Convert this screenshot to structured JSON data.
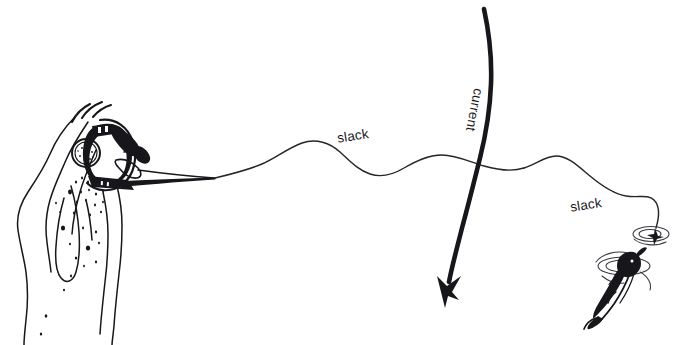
{
  "figure": {
    "background_color": "#ffffff",
    "ink_color": "#17161a",
    "width": 682,
    "height": 345
  },
  "labels": {
    "slack_upper": "slack",
    "slack_lower": "slack",
    "current": "current"
  },
  "elements": {
    "angler_arm": "angler-arm",
    "fishing_reel": "fishing-reel",
    "rod_tip": "rod-tip",
    "fishing_line": "fishing-line",
    "current_arrow": "current-arrow",
    "fish": "hooked-fish",
    "water_ripples": "water-ripples",
    "water_droplets": "water-droplets",
    "motion_lines": "motion-lines"
  }
}
